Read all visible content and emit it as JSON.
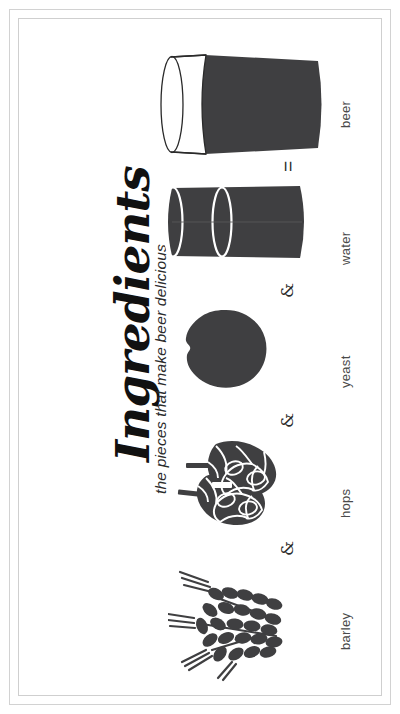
{
  "poster": {
    "title": "Ingredients",
    "subtitle": "the pieces that make beer delicious",
    "background_color": "#ffffff",
    "frame_color": "#d2d2d2",
    "ink_color": "#3f3f41",
    "text_color": "#4a4a4a"
  },
  "equation": {
    "operators": [
      {
        "symbol": "&",
        "name": "ampersand-barley-hops"
      },
      {
        "symbol": "&",
        "name": "ampersand-hops-yeast"
      },
      {
        "symbol": "&",
        "name": "ampersand-yeast-water"
      },
      {
        "symbol": "=",
        "name": "equals-water-beer"
      }
    ]
  },
  "ingredients": [
    {
      "label": "barley",
      "icon": "barley-icon"
    },
    {
      "label": "hops",
      "icon": "hops-icon"
    },
    {
      "label": "yeast",
      "icon": "yeast-icon"
    },
    {
      "label": "water",
      "icon": "water-glass-icon"
    },
    {
      "label": "beer",
      "icon": "beer-glass-icon"
    }
  ]
}
